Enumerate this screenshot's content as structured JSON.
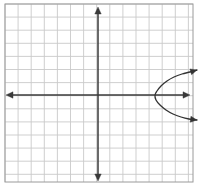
{
  "figure": {
    "width": 204,
    "height": 190,
    "background_color": "#ffffff"
  },
  "chart_data": {
    "type": "line",
    "title": "Rightward-opening parabola on a coordinate grid",
    "xlabel": "",
    "ylabel": "",
    "grid": true,
    "legend_position": "none",
    "xlim": [
      -7,
      7.5
    ],
    "ylim": [
      -6.6,
      7
    ],
    "axes": {
      "x_axis": {
        "label": "x-axis",
        "orientation": "horizontal",
        "pixel_y": 95,
        "pixel_x_start": 6,
        "pixel_x_end": 190,
        "arrow_start": true,
        "arrow_end": true,
        "color": "#3a3a3a"
      },
      "y_axis": {
        "label": "y-axis",
        "orientation": "vertical",
        "pixel_x": 98,
        "pixel_y_start": 7,
        "pixel_y_end": 181,
        "arrow_start": true,
        "arrow_end": true,
        "color": "#3a3a3a"
      }
    },
    "grid_spec": {
      "left": 5,
      "top": 4,
      "right": 193,
      "bottom": 182,
      "cell_size": 13.1,
      "columns": 14,
      "rows": 14,
      "minor_color": "#c9c9c9",
      "border_color": "#9a9a9a"
    },
    "series": [
      {
        "name": "parabola",
        "opens": "right",
        "vertex": [
          155,
          95
        ],
        "color": "#333333",
        "arrow_start": true,
        "arrow_end": true,
        "points": [
          [
            197,
            70
          ],
          [
            190,
            72
          ],
          [
            182,
            74
          ],
          [
            174,
            77
          ],
          [
            167,
            81
          ],
          [
            161,
            86
          ],
          [
            157,
            91
          ],
          [
            155,
            95
          ],
          [
            156,
            100
          ],
          [
            160,
            105
          ],
          [
            166,
            110
          ],
          [
            173,
            114
          ],
          [
            181,
            117
          ],
          [
            189,
            119
          ],
          [
            197,
            120
          ]
        ]
      }
    ],
    "annotations": []
  }
}
